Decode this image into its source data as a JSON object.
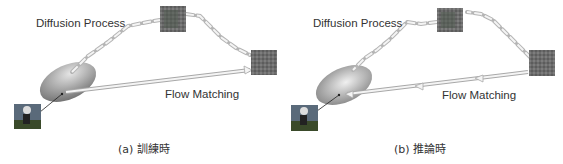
{
  "panels": [
    {
      "id": "a",
      "caption": "(a) 訓練時",
      "diffusion_label": "Diffusion Process",
      "flow_label": "Flow Matching",
      "direction": "data-to-noise"
    },
    {
      "id": "b",
      "caption": "(b) 推論時",
      "diffusion_label": "Diffusion Process",
      "flow_label": "Flow Matching",
      "direction": "noise-to-data"
    }
  ],
  "colors": {
    "ellipse_dark": "#7a7a7a",
    "ellipse_light": "#d8d8d8",
    "arrow_fill": "#f2f2f2",
    "arrow_stroke": "#b5b5b5",
    "noise": "#6e6e6e",
    "text": "#333333"
  }
}
